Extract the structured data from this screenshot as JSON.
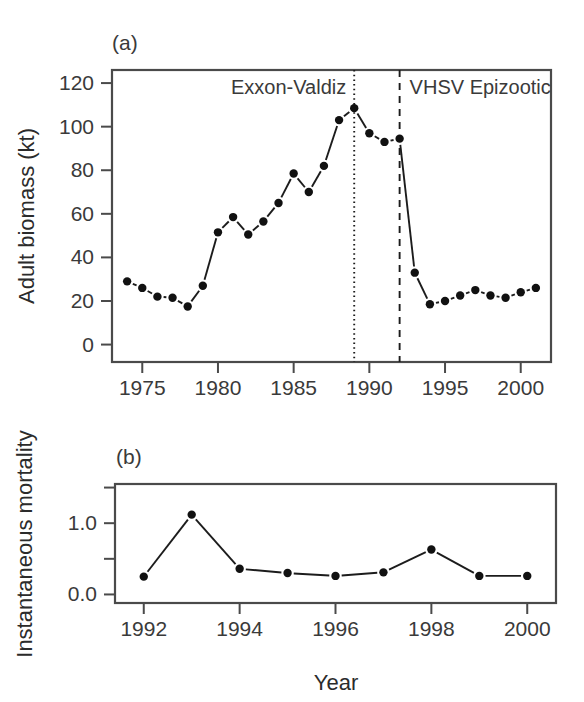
{
  "figure": {
    "width": 584,
    "height": 702,
    "background": "#ffffff",
    "ink_color": "#1c1c1c",
    "axis_color": "#4a4a4a"
  },
  "panel_a": {
    "label": "(a)",
    "ylabel": "Adult biomass (kt)",
    "annotations": [
      {
        "text": "Exxon-Valdiz",
        "year": 1989,
        "line_style": "dotted"
      },
      {
        "text": "VHSV Epizootic",
        "year": 1992,
        "line_style": "dashed"
      }
    ]
  },
  "panel_b": {
    "label": "(b)",
    "ylabel": "Instantaneous mortality",
    "xlabel": "Year"
  },
  "chart_data": [
    {
      "type": "line",
      "panel": "(a)",
      "title": "",
      "xlabel": "",
      "ylabel": "Adult biomass (kt)",
      "xlim": [
        1973,
        2002
      ],
      "ylim": [
        -8,
        126
      ],
      "grid": false,
      "legend": "none",
      "xticks": [
        1975,
        1980,
        1985,
        1990,
        1995,
        2000
      ],
      "xtick_labels": [
        "1975",
        "1980",
        "1985",
        "1990",
        "1995",
        "2000"
      ],
      "yticks": [
        0,
        20,
        40,
        60,
        80,
        100,
        120
      ],
      "ytick_labels": [
        "0",
        "20",
        "40",
        "60",
        "80",
        "100",
        "120"
      ],
      "marker": "filled-circle",
      "line_style": "solid-with-gaps",
      "x": [
        1974,
        1975,
        1976,
        1977,
        1978,
        1979,
        1980,
        1981,
        1982,
        1983,
        1984,
        1985,
        1986,
        1987,
        1988,
        1989,
        1990,
        1991,
        1992,
        1993,
        1994,
        1995,
        1996,
        1997,
        1998,
        1999,
        2000,
        2001
      ],
      "values": [
        29,
        26,
        22,
        21.5,
        17.5,
        27,
        51.5,
        58.5,
        50.5,
        56.5,
        65,
        78.5,
        70,
        82,
        103,
        108.5,
        97,
        93,
        94.5,
        33,
        18.5,
        20,
        22.5,
        25,
        22.5,
        21.5,
        24,
        26
      ],
      "annotations": [
        {
          "text": "Exxon-Valdiz",
          "x": 1989,
          "type": "vertical-dotted-line"
        },
        {
          "text": "VHSV Epizootic",
          "x": 1992,
          "type": "vertical-dashed-line"
        }
      ]
    },
    {
      "type": "line",
      "panel": "(b)",
      "title": "",
      "xlabel": "Year",
      "ylabel": "Instantaneous mortality",
      "xlim": [
        1991.4,
        2000.6
      ],
      "ylim": [
        -0.12,
        1.55
      ],
      "grid": false,
      "legend": "none",
      "xticks": [
        1992,
        1994,
        1996,
        1998,
        2000
      ],
      "xtick_labels": [
        "1992",
        "1994",
        "1996",
        "1998",
        "2000"
      ],
      "yticks": [
        0.0,
        0.5,
        1.0,
        1.5
      ],
      "ytick_labels": [
        "0.0",
        "",
        "1.0",
        ""
      ],
      "marker": "filled-circle",
      "line_style": "solid-with-gaps",
      "x": [
        1992,
        1993,
        1994,
        1995,
        1996,
        1997,
        1998,
        1999,
        2000
      ],
      "values": [
        0.25,
        1.12,
        0.36,
        0.3,
        0.26,
        0.31,
        0.63,
        0.26,
        0.26
      ]
    }
  ]
}
